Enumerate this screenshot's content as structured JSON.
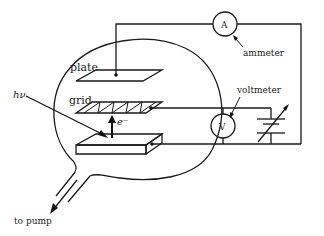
{
  "diagram": {
    "labels": {
      "plate": "plate",
      "grid": "grid",
      "photon": "hν",
      "electron": "e⁻",
      "ammeter": "ammeter",
      "ammeter_symbol": "A",
      "voltmeter": "voltmeter",
      "voltmeter_symbol": "V",
      "pump": "to pump"
    },
    "components": [
      {
        "id": "vacuum-bulb",
        "type": "glass envelope"
      },
      {
        "id": "plate",
        "type": "collector plate"
      },
      {
        "id": "grid",
        "type": "wire grid"
      },
      {
        "id": "cathode",
        "type": "photoemissive surface"
      },
      {
        "id": "ammeter",
        "type": "meter",
        "symbol": "A"
      },
      {
        "id": "voltmeter",
        "type": "meter",
        "symbol": "V"
      },
      {
        "id": "variable-battery",
        "type": "variable voltage source"
      },
      {
        "id": "pump-tube",
        "type": "vacuum outlet"
      }
    ],
    "colors": {
      "line": "#1a1a1a",
      "background": "#ffffff"
    }
  }
}
